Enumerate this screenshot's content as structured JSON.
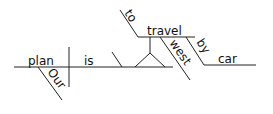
{
  "diagram": {
    "type": "sentence-diagram",
    "sentence_words": [
      "Our",
      "plan",
      "is",
      "to",
      "travel",
      "west",
      "by",
      "car"
    ],
    "subject": "plan",
    "subject_modifier": "Our",
    "verb": "is",
    "complement": {
      "infinitive_marker": "to",
      "verb": "travel",
      "adverb": "west",
      "preposition": "by",
      "object_of_preposition": "car"
    },
    "colors": {
      "ink": "#222222",
      "background": "#ffffff"
    }
  }
}
